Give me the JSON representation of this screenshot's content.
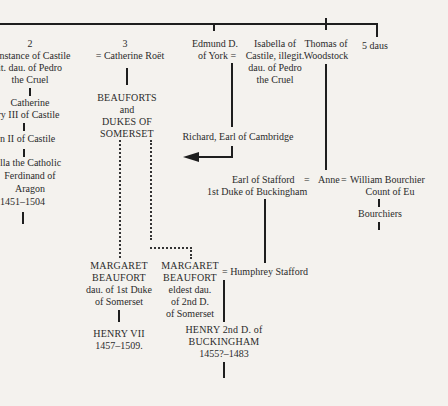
{
  "diagram": {
    "type": "genealogical-tree",
    "top_bar": {
      "label": ""
    },
    "column_2": {
      "number": "2",
      "spouse": [
        "nstance of Castile",
        "it. dau. of Pedro",
        "the Cruel"
      ],
      "child1": [
        "Catherine",
        "nry III of Castile"
      ],
      "child2": [
        "n II of Castile"
      ],
      "child3": [
        "lla the Catholic",
        "Ferdinand of",
        "Aragon",
        "1451–1504"
      ]
    },
    "column_3": {
      "number": "3",
      "spouse": "= Catherine Roët",
      "issue": [
        "BEAUFORTS",
        "and",
        "DUKES OF",
        "SOMERSET"
      ]
    },
    "edmund": {
      "name": [
        "Edmund D.",
        "of York ="
      ],
      "spouse": [
        "Isabella of",
        "Castile, illegit.",
        "dau. of Pedro",
        "the Cruel"
      ],
      "child": "Richard, Earl of Cambridge"
    },
    "thomas": {
      "name": [
        "Thomas of",
        "Woodstock"
      ]
    },
    "daughters": {
      "label": "5 daus"
    },
    "stafford": {
      "name": [
        "Earl of Stafford",
        "1st Duke of Buckingham"
      ],
      "eq1": "=",
      "anne": "Anne",
      "eq2": "=",
      "bourchier": [
        "William Bourchier",
        "Count of Eu"
      ],
      "issue": "Bourchiers"
    },
    "margaret1": {
      "name": [
        "MARGARET",
        "BEAUFORT"
      ],
      "desc": [
        "dau. of 1st Duke",
        "of Somerset"
      ],
      "child": [
        "HENRY VII",
        "1457–1509."
      ]
    },
    "margaret2": {
      "name": [
        "MARGARET",
        "BEAUFORT"
      ],
      "desc": [
        "eldest dau.",
        "of 2nd D.",
        "of Somerset"
      ],
      "spouse": "= Humphrey Stafford",
      "child": [
        "HENRY 2nd D. of",
        "BUCKINGHAM",
        "1455?–1483"
      ]
    }
  }
}
